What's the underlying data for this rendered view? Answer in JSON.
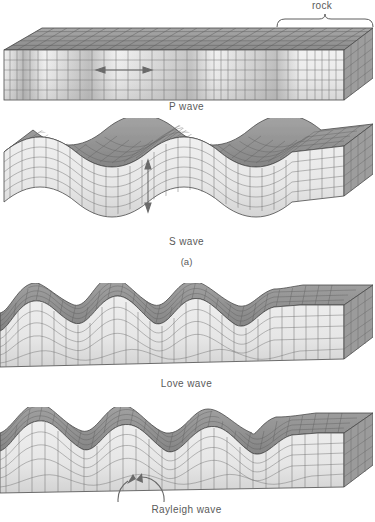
{
  "figure": {
    "type": "seismic-wave-block-diagrams",
    "title": "",
    "annotations": {
      "rock_label": "rock",
      "group_label_a": "(a)"
    },
    "panels": [
      {
        "id": "p-wave",
        "caption": "P wave",
        "wave_class": "body",
        "description": "Compressional body wave: block shows alternating compressed and dilated grid bands travelling horizontally",
        "surface": "flat",
        "motion_indicator": "horizontal-double-arrow",
        "motion_axis": "parallel-to-propagation",
        "cycles": 0,
        "amplitude": 0
      },
      {
        "id": "s-wave",
        "caption": "S wave",
        "wave_class": "body",
        "description": "Shear body wave: block flexes up and down in a smooth sine, grid columns displaced vertically",
        "surface": "sinusoidal",
        "motion_indicator": "vertical-double-arrow",
        "motion_axis": "perpendicular-to-propagation",
        "cycles": 3.5,
        "amplitude": 16
      },
      {
        "id": "love-wave",
        "caption": "Love wave",
        "wave_class": "surface",
        "description": "Surface wave: top of block undulates with sharp crests and broad troughs, grid sheared laterally; right end of block undeformed",
        "surface": "crested",
        "motion_indicator": "none",
        "motion_axis": "horizontal-transverse",
        "cycles": 3,
        "amplitude": 22
      },
      {
        "id": "rayleigh-wave",
        "caption": "Rayleigh wave",
        "wave_class": "surface",
        "description": "Surface wave: rolling crests on the top surface with a circular retrograde particle path drawn inside the block; right end undeformed",
        "surface": "rolling",
        "motion_indicator": "retrograde-circle-arrow",
        "motion_axis": "elliptical-vertical-plane",
        "cycles": 3,
        "amplitude": 20
      }
    ],
    "colors": {
      "front_face": "#e9e9e9",
      "front_face_shadow": "#d2d2d2",
      "top_face": "#8d8d8d",
      "top_face_light": "#b4b4b4",
      "side_face": "#9a9a9a",
      "grid_line": "#6f6f6f",
      "grid_line_top": "#4f4f4f",
      "outline": "#4a4a4a",
      "arrow": "#6a6a6a",
      "text": "#5a5a5a",
      "background": "#ffffff"
    }
  }
}
